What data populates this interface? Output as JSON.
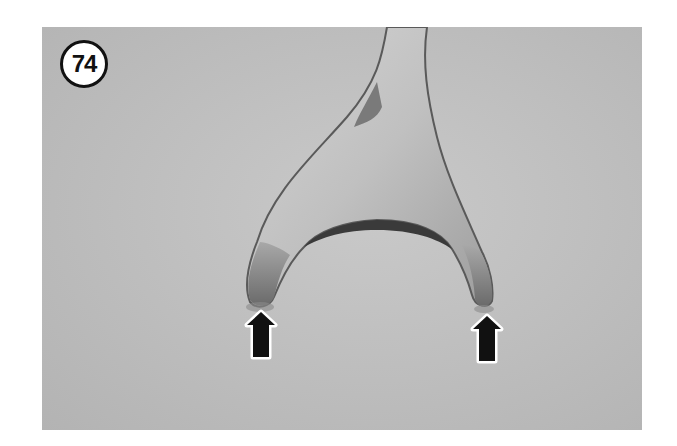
{
  "figure": {
    "step_number": "74",
    "arrows": [
      {
        "name": "left-arrow",
        "direction": "up",
        "target": "left fork tip"
      },
      {
        "name": "right-arrow",
        "direction": "up",
        "target": "right fork tip"
      }
    ],
    "colors": {
      "background": "#bdbdbd",
      "arrow": "#111111",
      "badge_fill": "#ffffff"
    }
  }
}
